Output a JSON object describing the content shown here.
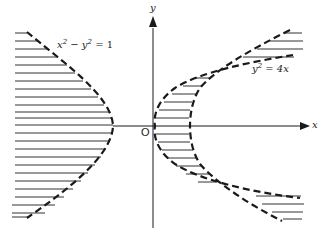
{
  "figure": {
    "type": "region-diagram",
    "axes": {
      "x_label": "x",
      "y_label": "y",
      "origin_label": "O"
    },
    "curves": [
      {
        "name": "hyperbola",
        "equation_base": "x",
        "equation_mid": " − y",
        "equation_end": " = 1",
        "exp1": "2",
        "exp2": "2",
        "style": "dashed"
      },
      {
        "name": "parabola",
        "equation_base": "y",
        "equation_end": " = 4x",
        "exp1": "2",
        "style": "dashed"
      }
    ],
    "shading": "horizontal hatch lines",
    "colors": {
      "ink": "#1a1a1a",
      "hatch": "#333333",
      "background": "#ffffff"
    }
  }
}
